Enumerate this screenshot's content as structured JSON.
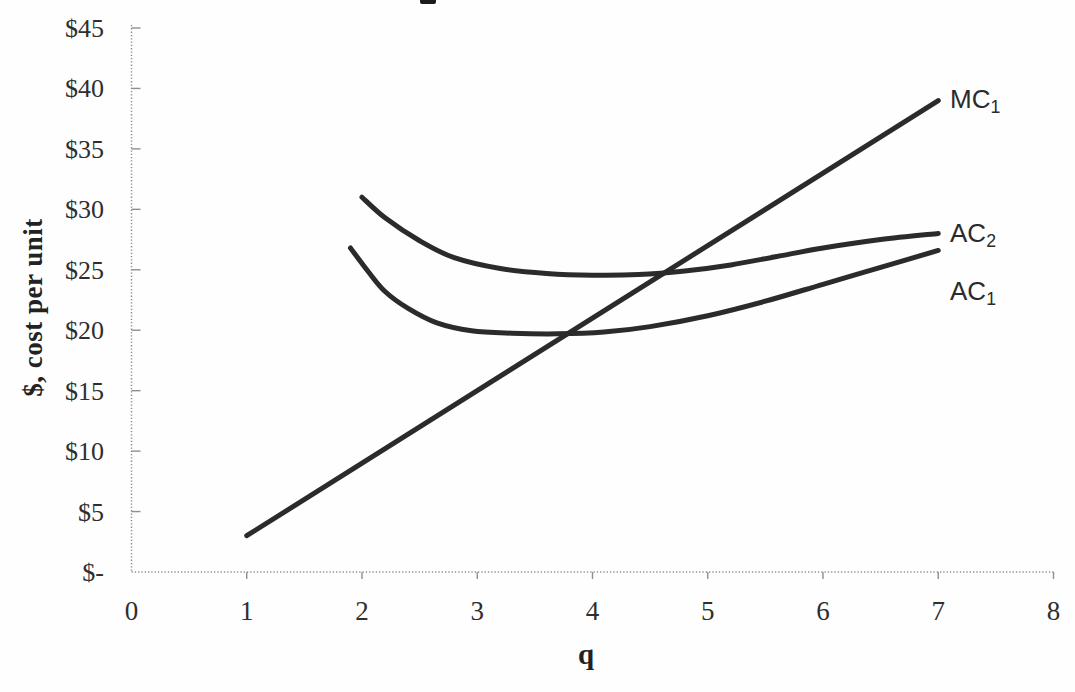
{
  "chart_data": {
    "type": "line",
    "title": "",
    "xlabel": "q",
    "ylabel": "$, cost per unit",
    "xlim": [
      0,
      8
    ],
    "ylim": [
      0,
      45
    ],
    "grid": false,
    "legend_position": "inline-curve-labels",
    "x_ticks": {
      "values": [
        0,
        1,
        2,
        3,
        4,
        5,
        6,
        7,
        8
      ],
      "labels": [
        "0",
        "1",
        "2",
        "3",
        "4",
        "5",
        "6",
        "7",
        "8"
      ]
    },
    "y_ticks": {
      "values": [
        0,
        5,
        10,
        15,
        20,
        25,
        30,
        35,
        40,
        45
      ],
      "labels": [
        "$-",
        "$5",
        "$10",
        "$15",
        "$20",
        "$25",
        "$30",
        "$35",
        "$40",
        "$45"
      ]
    },
    "colors": {
      "line": "#2b2b2b",
      "axis": "#8f8f8f",
      "text": "#2e2e2e"
    },
    "plot_area_px": {
      "left": 131.5,
      "right": 1053.5,
      "top": 28,
      "bottom": 572,
      "axis_top": 25
    },
    "series": [
      {
        "name": "MC1",
        "label": "MC",
        "label_sub": "1",
        "points": [
          [
            1,
            3
          ],
          [
            7,
            39
          ]
        ],
        "label_pos_px": [
          950,
          85
        ]
      },
      {
        "name": "AC2",
        "label": "AC",
        "label_sub": "2",
        "points": [
          [
            2,
            31
          ],
          [
            2.2,
            29.3
          ],
          [
            2.5,
            27.4
          ],
          [
            2.8,
            26.0
          ],
          [
            3.2,
            25.1
          ],
          [
            3.6,
            24.7
          ],
          [
            4.0,
            24.55
          ],
          [
            4.4,
            24.6
          ],
          [
            4.8,
            24.9
          ],
          [
            5.2,
            25.4
          ],
          [
            5.6,
            26.1
          ],
          [
            6.0,
            26.8
          ],
          [
            6.5,
            27.5
          ],
          [
            7,
            28
          ]
        ],
        "label_pos_px": [
          950,
          219
        ]
      },
      {
        "name": "AC1",
        "label": "AC",
        "label_sub": "1",
        "points": [
          [
            1.9,
            26.8
          ],
          [
            2.05,
            24.9
          ],
          [
            2.2,
            23.2
          ],
          [
            2.4,
            21.8
          ],
          [
            2.65,
            20.6
          ],
          [
            2.95,
            19.95
          ],
          [
            3.3,
            19.75
          ],
          [
            3.7,
            19.7
          ],
          [
            4.1,
            19.85
          ],
          [
            4.5,
            20.3
          ],
          [
            5.0,
            21.2
          ],
          [
            5.5,
            22.4
          ],
          [
            6.0,
            23.8
          ],
          [
            6.5,
            25.2
          ],
          [
            7,
            26.6
          ]
        ],
        "label_pos_px": [
          950,
          277
        ]
      }
    ]
  },
  "artifacts": {
    "cropped_title_fragment": {
      "visible": true,
      "x_px": 420,
      "y_px": 0,
      "width_px": 16,
      "height_px": 4
    }
  }
}
